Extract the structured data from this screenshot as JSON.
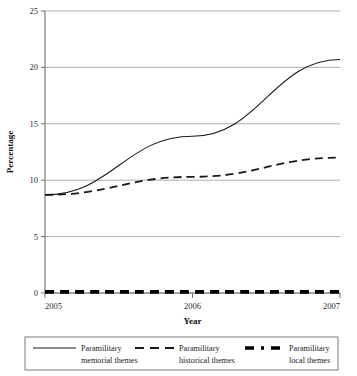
{
  "chart_data": {
    "type": "line",
    "title": "",
    "xlabel": "Year",
    "ylabel": "Percentage",
    "x": [
      2005,
      2006,
      2007
    ],
    "xtick_labels": [
      "2005",
      "2006",
      "2007"
    ],
    "ytick_labels": [
      "0",
      "5",
      "10",
      "15",
      "20",
      "25"
    ],
    "ytick_values": [
      0,
      5,
      10,
      15,
      20,
      25
    ],
    "xlim": [
      2005,
      2007
    ],
    "ylim": [
      0,
      25
    ],
    "grid": "horizontal",
    "legend_position": "below",
    "series": [
      {
        "name": "Paramilitary memorial themes",
        "name_line1": "Paramilitary",
        "name_line2": "memorial themes",
        "style": "solid",
        "color": "#1a1a1a",
        "values": [
          8.7,
          13.9,
          20.7
        ]
      },
      {
        "name": "Paramilitary historical themes",
        "name_line1": "Paramilitary",
        "name_line2": "historical themes",
        "style": "dashed",
        "color": "#1a1a1a",
        "values": [
          8.7,
          10.3,
          12.0
        ]
      },
      {
        "name": "Paramilitary local themes",
        "name_line1": "Paramilitary",
        "name_line2": "local themes",
        "style": "thick-dashed",
        "color": "#000000",
        "values": [
          0.1,
          0.1,
          0.1
        ]
      }
    ]
  }
}
